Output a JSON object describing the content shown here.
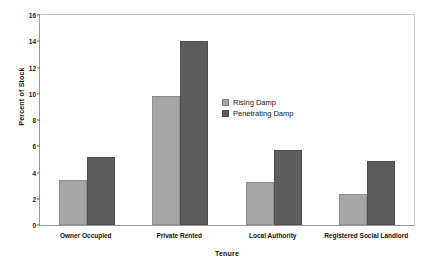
{
  "chart_data": {
    "type": "bar",
    "title": "",
    "xlabel": "Tenure",
    "ylabel": "Percent of Stock",
    "categories": [
      "Owner Occupied",
      "Private Rented",
      "Local Authority",
      "Registered Social Landlord"
    ],
    "series": [
      {
        "name": "Rising Damp",
        "values": [
          3.4,
          9.8,
          3.3,
          2.4
        ],
        "color": "#a6a6a6"
      },
      {
        "name": "Penetrating Damp",
        "values": [
          5.2,
          14.0,
          5.7,
          4.9
        ],
        "color": "#5d5d5d"
      }
    ],
    "ylim": [
      0,
      16
    ],
    "yticks": [
      0,
      2,
      4,
      6,
      8,
      10,
      12,
      14,
      16
    ],
    "ytick_labels": [
      "0",
      "2",
      "4",
      "6",
      "8",
      "10",
      "12",
      "14",
      "16"
    ],
    "grid": false,
    "legend_position": "inside-center-right",
    "legend": [
      "Rising Damp",
      "Penetrating Damp"
    ]
  },
  "axes": {
    "y_title": "Percent of Stock",
    "x_title": "Tenure"
  },
  "legend": {
    "entries": [
      {
        "label": "Rising Damp",
        "swatch": "legend-swatch-rising-damp"
      },
      {
        "label": "Penetrating Damp",
        "swatch": "legend-swatch-penetrating-damp"
      }
    ]
  }
}
